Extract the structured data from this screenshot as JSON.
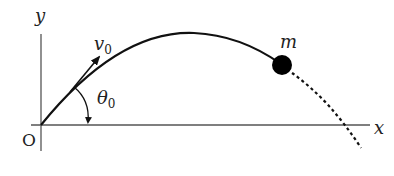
{
  "diagram": {
    "type": "projectile-motion",
    "labels": {
      "y_axis": "y",
      "x_axis": "x",
      "origin": "O",
      "velocity": "v",
      "velocity_sub": "0",
      "angle": "θ",
      "angle_sub": "0",
      "mass": "m"
    },
    "colors": {
      "stroke": "#111111",
      "axis": "#555555",
      "background": "#ffffff"
    }
  }
}
